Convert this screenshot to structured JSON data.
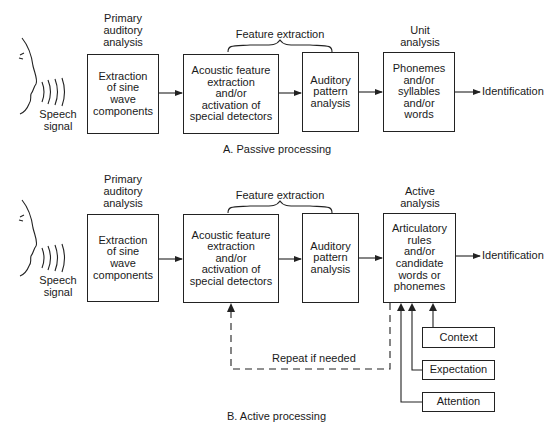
{
  "passive": {
    "caption": "A.  Passive processing",
    "speech_signal": "Speech\nsignal",
    "stage_labels": {
      "primary": "Primary\nauditory\nanalysis",
      "feature": "Feature extraction",
      "unit": "Unit\nanalysis"
    },
    "boxes": [
      "Extraction\nof sine\nwave\ncomponents",
      "Acoustic feature\nextraction\nand/or\nactivation of\nspecial detectors",
      "Auditory\npattern\nanalysis",
      "Phonemes\nand/or\nsyllables\nand/or\nwords"
    ],
    "output": "Identification"
  },
  "active": {
    "caption": "B.  Active processing",
    "speech_signal": "Speech\nsignal",
    "stage_labels": {
      "primary": "Primary\nauditory\nanalysis",
      "feature": "Feature extraction",
      "active": "Active\nanalysis"
    },
    "boxes": [
      "Extraction\nof sine\nwave\ncomponents",
      "Acoustic feature\nextraction\nand/or\nactivation of\nspecial detectors",
      "Auditory\npattern\nanalysis",
      "Articulatory\nrules\nand/or\ncandidate\nwords or\nphonemes"
    ],
    "output": "Identification",
    "feedback_label": "Repeat if needed",
    "inputs": [
      "Context",
      "Expectation",
      "Attention"
    ]
  }
}
